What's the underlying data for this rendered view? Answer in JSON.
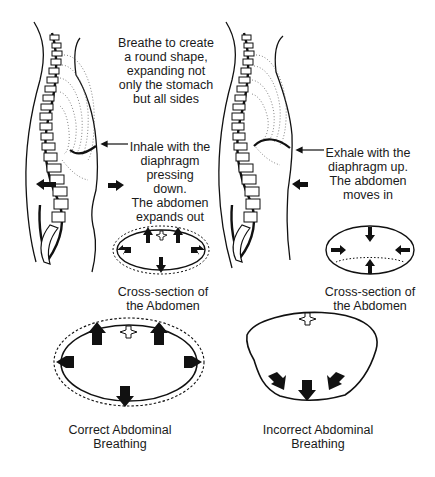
{
  "figure": {
    "left_panel": {
      "title_note": [
        "Breathe to create",
        "a round shape,",
        "expanding not",
        "only the stomach",
        "but all sides"
      ],
      "inhale_note": [
        "Inhale with the",
        "diaphragm",
        "pressing down.",
        "The abdomen",
        "expands out"
      ],
      "cross_section_label": [
        "Cross-section of",
        "the Abdomen"
      ]
    },
    "right_panel": {
      "exhale_note": [
        "Exhale with the",
        "diaphragm up.",
        "The abdomen",
        "moves in"
      ],
      "cross_section_label": [
        "Cross-section of",
        "the Abdomen"
      ]
    },
    "bottom_left": {
      "caption": [
        "Correct Abdominal",
        "Breathing"
      ]
    },
    "bottom_right": {
      "caption": [
        "Incorrect Abdominal",
        "Breathing"
      ]
    },
    "colors": {
      "ink": "#111111",
      "background": "#ffffff",
      "stipple": "#555555"
    }
  }
}
